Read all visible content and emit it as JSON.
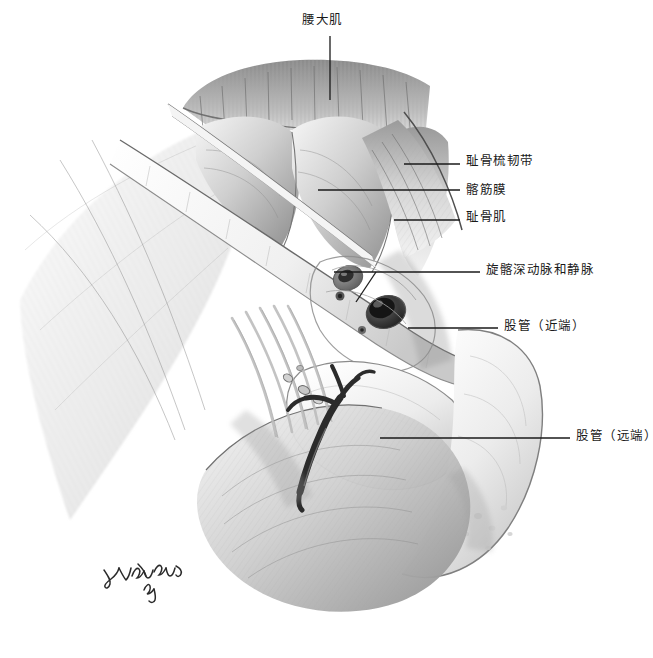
{
  "figure": {
    "kind": "anatomical-illustration",
    "style": "grayscale-pencil-drawing",
    "background_color": "#ffffff",
    "ink_color": "#1a1a1a",
    "width": 653,
    "height": 658
  },
  "labels": [
    {
      "id": "psoas-major",
      "text": "腰大肌",
      "x": 302,
      "y": 14,
      "anchor": "center",
      "leader": [
        [
          330,
          36
        ],
        [
          330,
          100
        ]
      ]
    },
    {
      "id": "pectineal-ligament",
      "text": "耻骨梳韧带",
      "x": 466,
      "y": 155,
      "anchor": "left",
      "leader": [
        [
          404,
          164
        ],
        [
          460,
          164
        ]
      ]
    },
    {
      "id": "iliac-fascia",
      "text": "髂筋膜",
      "x": 466,
      "y": 184,
      "anchor": "left",
      "leader": [
        [
          318,
          190
        ],
        [
          460,
          190
        ]
      ]
    },
    {
      "id": "pectineus-muscle",
      "text": "耻骨肌",
      "x": 466,
      "y": 211,
      "anchor": "left",
      "leader": [
        [
          394,
          220
        ],
        [
          460,
          220
        ]
      ]
    },
    {
      "id": "deep-circumflex-iliac-vessels",
      "text": "旋髂深动脉和静脉",
      "x": 486,
      "y": 264,
      "anchor": "left",
      "leader": [
        [
          334,
          272
        ],
        [
          480,
          272
        ]
      ],
      "leader2": [
        [
          356,
          300
        ],
        [
          374,
          272
        ]
      ]
    },
    {
      "id": "femoral-canal-proximal",
      "text": "股管（近端）",
      "x": 504,
      "y": 320,
      "anchor": "left",
      "leader": [
        [
          408,
          328
        ],
        [
          498,
          328
        ]
      ]
    },
    {
      "id": "femoral-canal-distal",
      "text": "股管（远端）",
      "x": 576,
      "y": 430,
      "anchor": "left",
      "leader": [
        [
          380,
          438
        ],
        [
          570,
          438
        ]
      ]
    }
  ],
  "signature": {
    "artist_mark": "Yuri Wind",
    "x": 98,
    "y": 556
  },
  "palette": {
    "paper": "#ffffff",
    "light_gray": "#e9e9e9",
    "mid_gray": "#b8b8b8",
    "dark_gray": "#7a7a7a",
    "shadow": "#4a4a4a",
    "vessel": "#2b2b2b",
    "text": "#1a1a1a"
  }
}
